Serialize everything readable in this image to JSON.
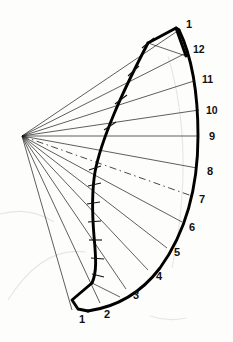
{
  "figure": {
    "type": "technical-line-drawing",
    "apex": {
      "x": 22,
      "y": 136
    },
    "outer_radius": 176,
    "stroke_color": "#000000",
    "thin_line_color": "#1a1a1a",
    "background_color": "#fdfdfc"
  },
  "outer_arc_labels": [
    {
      "text": "1",
      "x": 186,
      "y": 25,
      "ray": 1
    },
    {
      "text": "12",
      "x": 193,
      "y": 50,
      "ray": 2
    },
    {
      "text": "11",
      "x": 205,
      "y": 80,
      "ray": 3
    },
    {
      "text": "10",
      "x": 210,
      "y": 112,
      "ray": 4
    },
    {
      "text": "9",
      "x": 213,
      "y": 137,
      "ray": 5
    },
    {
      "text": "8",
      "x": 210,
      "y": 172,
      "ray": 6
    },
    {
      "text": "7",
      "x": 201,
      "y": 199,
      "ray": 7
    },
    {
      "text": "6",
      "x": 190,
      "y": 227,
      "ray": 8
    },
    {
      "text": "5",
      "x": 175,
      "y": 253,
      "ray": 9
    },
    {
      "text": "4",
      "x": 157,
      "y": 276,
      "ray": 10
    },
    {
      "text": "3",
      "x": 133,
      "y": 295,
      "ray": 11
    },
    {
      "text": "2",
      "x": 104,
      "y": 313,
      "ray": 12
    },
    {
      "text": "1",
      "x": 79,
      "y": 319,
      "ray": 13
    }
  ],
  "rays": {
    "count": 13,
    "dashed_ray_label": "7",
    "angles_deg": [
      -39.5,
      -29.0,
      -19.5,
      -10.0,
      0.0,
      10.5,
      20.0,
      29.5,
      39.0,
      48.5,
      57.5,
      66.0,
      73.5
    ]
  },
  "inner_curve": {
    "description": "developed edge curve with cross tick marks",
    "tick_count": 13
  },
  "caps": {
    "top_label": "1",
    "bottom_label": "1",
    "description": "closed quadrilateral end panels joining inner curve to outer arc"
  }
}
